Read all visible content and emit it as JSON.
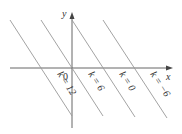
{
  "diagram": {
    "axes": {
      "x_label": "x",
      "y_label": "y",
      "origin_label": "0"
    },
    "lines": [
      {
        "label": "k = 12"
      },
      {
        "label": "k = 6"
      },
      {
        "label": "k = 0"
      },
      {
        "label": "k = −6"
      }
    ],
    "colors": {
      "line": "#888888",
      "axis": "#555555",
      "text": "#333333"
    }
  }
}
